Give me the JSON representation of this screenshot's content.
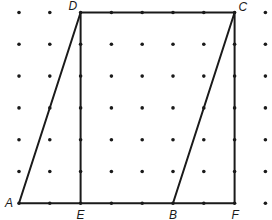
{
  "diagram": {
    "type": "dot-grid geometry figure",
    "grid": {
      "columns": 9,
      "rows": 7
    },
    "points": [
      {
        "label": "A",
        "col": 0,
        "row": 6
      },
      {
        "label": "E",
        "col": 2,
        "row": 6
      },
      {
        "label": "B",
        "col": 5,
        "row": 6
      },
      {
        "label": "F",
        "col": 7,
        "row": 6
      },
      {
        "label": "D",
        "col": 2,
        "row": 0
      },
      {
        "label": "C",
        "col": 7,
        "row": 0
      }
    ],
    "segments": [
      [
        "A",
        "D"
      ],
      [
        "D",
        "C"
      ],
      [
        "C",
        "B"
      ],
      [
        "A",
        "F"
      ],
      [
        "D",
        "E"
      ],
      [
        "C",
        "F"
      ]
    ],
    "colors": {
      "ink": "#1a1a1a",
      "background": "#ffffff"
    }
  }
}
